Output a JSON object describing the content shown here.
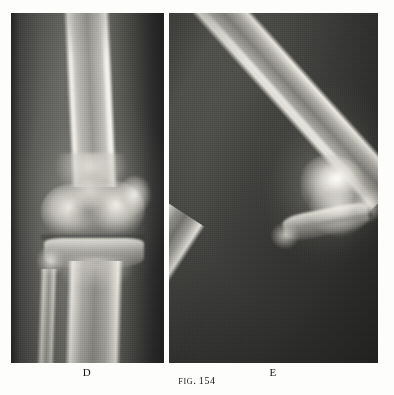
{
  "page": {
    "kind": "book-figure-plate",
    "background_color": "#fdfdfb",
    "ink_color": "#161616"
  },
  "figure": {
    "caption_prefix": "Fig.",
    "caption_number": "154",
    "caption_full": "FIG. 154"
  },
  "panels": [
    {
      "id": "plate-d",
      "label": "D",
      "modality": "radiograph",
      "view": "anteroposterior knee",
      "film_color": "#3a3a38",
      "bone_color": "#efeee6"
    },
    {
      "id": "plate-e",
      "label": "E",
      "modality": "radiograph",
      "view": "lateral knee, flexed",
      "film_color": "#343432",
      "bone_color": "#efeee6"
    }
  ]
}
